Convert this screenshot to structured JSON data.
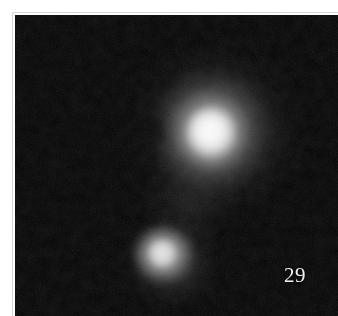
{
  "figure": {
    "plate_number": "29",
    "caption": "",
    "background_color": "#000000",
    "margin_color": "#ffffff",
    "plate_edge_color": "#d8d8d8",
    "label_color": "#f2f2f2"
  },
  "field": {
    "width_px": 323,
    "height_px": 301,
    "offset_x_px": 15,
    "offset_y_px": 15
  },
  "sources": [
    {
      "name": "primary-source",
      "role": "bright central nebulous object",
      "center_x_px": 196,
      "center_y_px": 116,
      "core_radius_px": 21,
      "halo_radius_px": 96,
      "peak_gray": "#fbfbfb"
    },
    {
      "name": "companion-source",
      "role": "fainter companion below and left of primary",
      "center_x_px": 147,
      "center_y_px": 246,
      "core_radius_px": 14,
      "halo_radius_px": 56,
      "peak_gray": "#e8e8e8"
    }
  ],
  "features": [
    {
      "name": "dark-notch",
      "role": "dark absorption lane on west flank of primary",
      "center_x_px": 139,
      "center_y_px": 117
    },
    {
      "name": "nebulous-bridge",
      "role": "faint diffuse emission between the two sources",
      "center_x_px": 172,
      "center_y_px": 188
    }
  ]
}
